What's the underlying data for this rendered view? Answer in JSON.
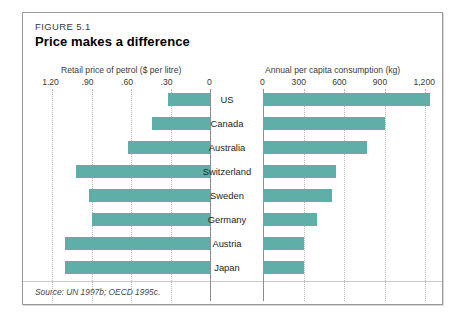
{
  "figure": {
    "label": "FIGURE 5.1",
    "title": "Price makes a difference",
    "source": "Source: UN 1997b; OECD 1995c."
  },
  "chart_data": {
    "type": "bar",
    "title": "Price makes a difference",
    "orientation": "horizontal",
    "layout": "back-to-back paired bars, left axis reversed",
    "grid": true,
    "legend": "none",
    "categories": [
      "US",
      "Canada",
      "Australia",
      "Switzerland",
      "Sweden",
      "Germany",
      "Austria",
      "Japan"
    ],
    "series": [
      {
        "name": "Retail price of petrol ($ per litre)",
        "axis": "left",
        "xlabel": "Retail price of petrol ($ per litre)",
        "ticks": [
          "1.20",
          ".90",
          ".60",
          ".30",
          "0"
        ],
        "tick_values": [
          1.2,
          0.9,
          0.6,
          0.3,
          0
        ],
        "xlim": [
          1.3,
          0
        ],
        "direction": "right-to-left",
        "values": [
          0.32,
          0.44,
          0.62,
          1.02,
          0.92,
          0.9,
          1.1,
          1.1
        ]
      },
      {
        "name": "Annual per capita consumption (kg)",
        "axis": "right",
        "xlabel": "Annual per capita consumption (kg)",
        "ticks": [
          "0",
          "300",
          "600",
          "900",
          "1,200"
        ],
        "tick_values": [
          0,
          300,
          600,
          900,
          1200
        ],
        "xlim": [
          0,
          1300
        ],
        "direction": "left-to-right",
        "values": [
          1230,
          900,
          770,
          540,
          510,
          400,
          300,
          300
        ]
      }
    ]
  },
  "style": {
    "bar_color": "#5FAFA8",
    "grid_color": "#b9b9b9",
    "axis_color": "#8d8d8d",
    "frame_border": "#9a9a9a"
  }
}
